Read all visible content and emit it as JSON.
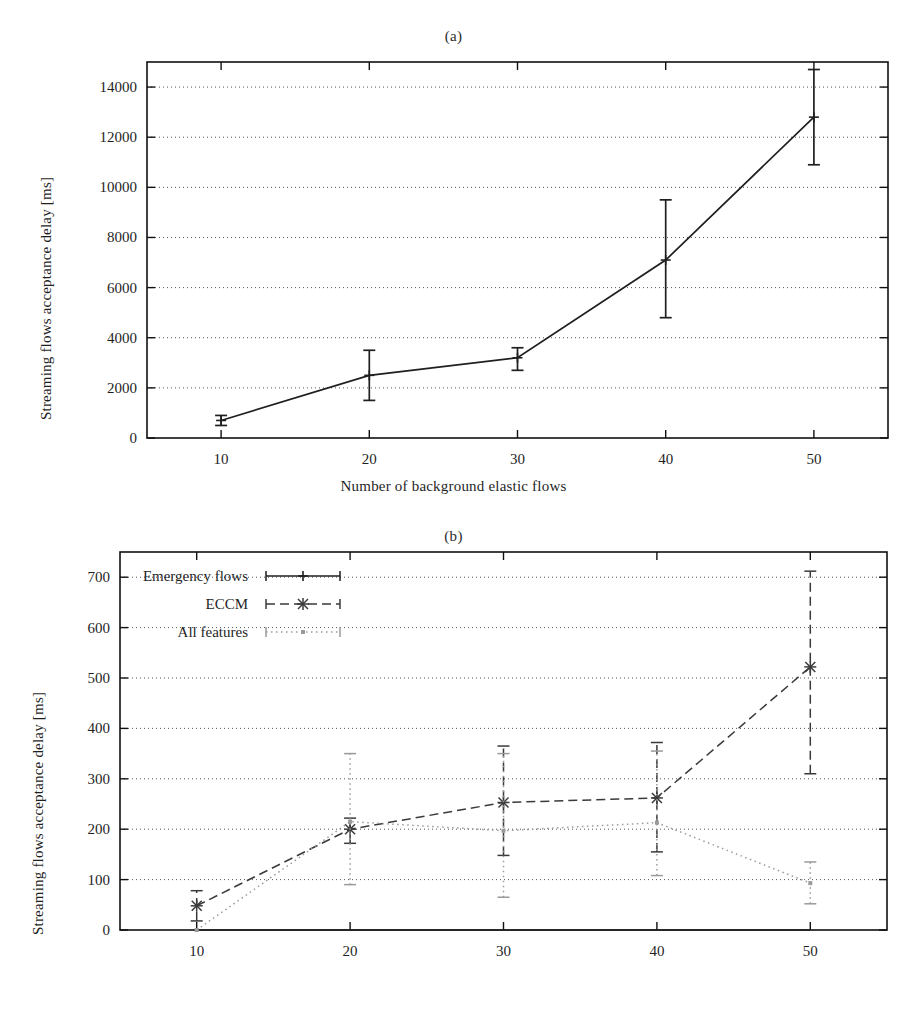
{
  "figure": {
    "background": "#ffffff",
    "ink": "#1f1f1f"
  },
  "chart_data": [
    {
      "id": "panel-a",
      "type": "line",
      "title": "(a)",
      "xlabel": "Number of background elastic flows",
      "ylabel": "Streaming flows acceptance delay [ms]",
      "x": [
        10,
        20,
        30,
        40,
        50
      ],
      "xtick_labels": [
        "10",
        "20",
        "30",
        "40",
        "50"
      ],
      "ytick_labels": [
        "0",
        "2000",
        "4000",
        "6000",
        "8000",
        "10000",
        "12000",
        "14000"
      ],
      "yticks": [
        0,
        2000,
        4000,
        6000,
        8000,
        10000,
        12000,
        14000
      ],
      "xlim": [
        5,
        55
      ],
      "ylim": [
        0,
        15000
      ],
      "grid": "horizontal-dotted",
      "legend": null,
      "series": [
        {
          "name": "Emergency flows",
          "style": "solid",
          "marker": "plus",
          "color": "#1f1f1f",
          "values": [
            700,
            2500,
            3200,
            7100,
            12800
          ],
          "err_low": [
            500,
            1500,
            2700,
            4800,
            10900
          ],
          "err_high": [
            900,
            3500,
            3600,
            9500,
            14700
          ]
        }
      ]
    },
    {
      "id": "panel-b",
      "type": "line",
      "title": "(b)",
      "xlabel": "Number of background elastic flows",
      "ylabel": "Streaming flows acceptance delay [ms]",
      "x": [
        10,
        20,
        30,
        40,
        50
      ],
      "xtick_labels": [
        "10",
        "20",
        "30",
        "40",
        "50"
      ],
      "ytick_labels": [
        "0",
        "100",
        "200",
        "300",
        "400",
        "500",
        "600",
        "700"
      ],
      "yticks": [
        0,
        100,
        200,
        300,
        400,
        500,
        600,
        700
      ],
      "xlim": [
        5,
        55
      ],
      "ylim": [
        0,
        750
      ],
      "grid": "horizontal-dotted",
      "legend": {
        "position": "top-left-inside",
        "entries": [
          {
            "label": "Emergency flows",
            "style": "solid",
            "marker": "plus"
          },
          {
            "label": "ECCM",
            "style": "dashed",
            "marker": "cross"
          },
          {
            "label": "All features",
            "style": "dotted",
            "marker": "dot"
          }
        ]
      },
      "series": [
        {
          "name": "Emergency flows",
          "style": "solid",
          "marker": "plus",
          "color": "#1f1f1f",
          "values": [
            0,
            0,
            0,
            0,
            0
          ],
          "err_low": [
            0,
            0,
            0,
            0,
            0
          ],
          "err_high": [
            0,
            0,
            0,
            0,
            0
          ]
        },
        {
          "name": "ECCM",
          "style": "dashed",
          "marker": "cross",
          "color": "#3a3a3a",
          "values": [
            48,
            200,
            253,
            262,
            522
          ],
          "err_low": [
            18,
            172,
            148,
            155,
            310
          ],
          "err_high": [
            78,
            222,
            365,
            372,
            712
          ]
        },
        {
          "name": "All features",
          "style": "dotted",
          "marker": "dot",
          "color": "#9a9a9a",
          "values": [
            0,
            215,
            197,
            213,
            93
          ],
          "err_low": [
            0,
            90,
            65,
            108,
            52
          ],
          "err_high": [
            0,
            350,
            350,
            355,
            135
          ]
        }
      ]
    }
  ]
}
